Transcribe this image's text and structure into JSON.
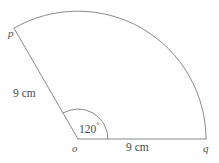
{
  "figure": {
    "type": "circular-sector",
    "background_color": "#ffffff",
    "stroke_color": "#8a8a8a",
    "text_color": "#4a4a4a",
    "vertices": {
      "center_label": "o",
      "arc_start_label": "q",
      "arc_end_label": "p"
    },
    "labels": {
      "radius_left": "9 cm",
      "radius_bottom": "9 cm",
      "angle_value": "120",
      "angle_unit": "°"
    },
    "geometry": {
      "center_x": 78,
      "center_y": 139,
      "radius_px": 128,
      "start_angle_deg": 0,
      "sweep_angle_deg": 120,
      "angle_marker_radius_px": 30,
      "point_q_x": 206,
      "point_q_y": 139,
      "point_p_x": 14,
      "point_p_y": 28,
      "radius_cm": 9,
      "central_angle_deg": 120
    }
  }
}
